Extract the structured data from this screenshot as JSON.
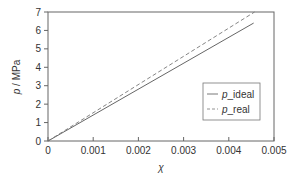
{
  "chart_data": {
    "type": "line",
    "title": "",
    "xlabel": "χ",
    "ylabel": "p / MPa",
    "xlim": [
      0,
      0.005
    ],
    "ylim": [
      0,
      7
    ],
    "grid": false,
    "legend_position": "lower right (inside)",
    "x_ticks": [
      "0",
      "0.001",
      "0.002",
      "0.003",
      "0.004",
      "0.005"
    ],
    "y_ticks": [
      "0",
      "1",
      "2",
      "3",
      "4",
      "5",
      "6",
      "7"
    ],
    "series": [
      {
        "name": "p_ideal",
        "style": "solid",
        "color": "#555555",
        "x": [
          0,
          0.00455
        ],
        "y": [
          0,
          6.4
        ]
      },
      {
        "name": "p_real",
        "style": "dashed",
        "color": "#777777",
        "x": [
          0,
          0.00457
        ],
        "y": [
          0,
          7.0
        ]
      }
    ],
    "legend": [
      {
        "italic": "p",
        "rest": "_ideal",
        "style": "solid"
      },
      {
        "italic": "p",
        "rest": "_real",
        "style": "dashed"
      }
    ]
  }
}
